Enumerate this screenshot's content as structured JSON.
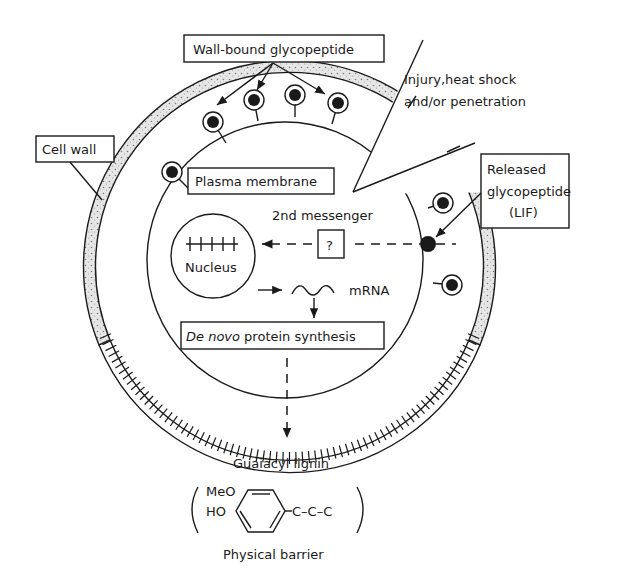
{
  "labels": {
    "wall_bound": "Wall-bound glycopeptide",
    "injury_line1": "Injury,heat shock",
    "injury_line2": "and/or penetration",
    "cell_wall": "Cell wall",
    "released_line1": "Released",
    "released_line2": "glycopeptide",
    "released_line3": "(LIF)",
    "plasma_membrane": "Plasma membrane",
    "second_messenger": "2nd messenger",
    "unknown": "?",
    "nucleus": "Nucleus",
    "mrna": "mRNA",
    "de_novo_italic": "De novo",
    "de_novo_rest": " protein synthesis",
    "guaiacyl": "Guaiacyl lignin",
    "meo": "MeO",
    "ho": "HO",
    "side_chain": "C–C–C",
    "barrier": "Physical barrier"
  },
  "colors": {
    "ink": "#1a1a1a",
    "wall_fill": "#d9d9d9",
    "background": "#ffffff"
  }
}
